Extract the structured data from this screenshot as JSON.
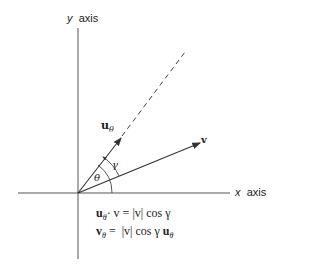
{
  "diagram": {
    "axes": {
      "y_label_var": "y",
      "y_label_text": "axis",
      "x_label_var": "x",
      "x_label_text": "axis"
    },
    "vectors": {
      "u_theta": {
        "symbol": "u",
        "subscript": "θ"
      },
      "v": {
        "symbol": "v"
      }
    },
    "angles": {
      "theta": "θ",
      "gamma": "γ"
    },
    "equations": {
      "line1": {
        "lhs_sym": "u",
        "lhs_sub": "θ",
        "lhs_rest": "· v = |v| cos γ"
      },
      "line2": {
        "lhs_sym": "v",
        "lhs_sub": "θ",
        "mid": " =  |v| cos γ ",
        "rhs_sym": "u",
        "rhs_sub": "θ"
      }
    }
  }
}
